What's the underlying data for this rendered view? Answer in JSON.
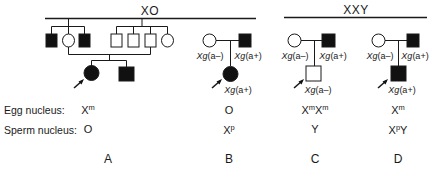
{
  "groups": [
    {
      "label": "XO",
      "x": 150,
      "line": [
        45,
        256
      ]
    },
    {
      "label": "XXY",
      "x": 356,
      "line": [
        284,
        427
      ]
    }
  ],
  "pedigrees": {
    "A": {
      "panel_label": "A",
      "egg": {
        "base": "X",
        "sup": "m"
      },
      "sperm": {
        "base": "O",
        "sup": ""
      }
    },
    "B": {
      "panel_label": "B",
      "mother_xg": "Xg(a-)",
      "father_xg": "Xg(a+)",
      "proband_xg": "Xg(a+)",
      "egg": {
        "base": "O",
        "sup": ""
      },
      "sperm": {
        "base": "X",
        "sup": "p"
      }
    },
    "C": {
      "panel_label": "C",
      "mother_xg": "Xg(a-)",
      "father_xg": "Xg(a+)",
      "proband_xg": "Xg(a-)",
      "egg": {
        "text": "XᵐXᵐ",
        "parts": [
          {
            "base": "X",
            "sup": "m"
          },
          {
            "base": "X",
            "sup": "m"
          }
        ]
      },
      "sperm": {
        "base": "Y",
        "sup": ""
      }
    },
    "D": {
      "panel_label": "D",
      "mother_xg": "Xg(a-)",
      "father_xg": "Xg(a+)",
      "proband_xg": "Xg(a+)",
      "egg": {
        "base": "X",
        "sup": "m"
      },
      "sperm": {
        "parts": [
          {
            "base": "X",
            "sup": "p"
          },
          {
            "base": "Y",
            "sup": ""
          }
        ]
      }
    }
  },
  "rows": {
    "egg_label": "Egg nucleus:",
    "sperm_label": "Sperm nucleus:"
  },
  "xg_prefix": "Xg",
  "xg_suffix_minus": "(a–)",
  "xg_suffix_plus": "(a+)"
}
